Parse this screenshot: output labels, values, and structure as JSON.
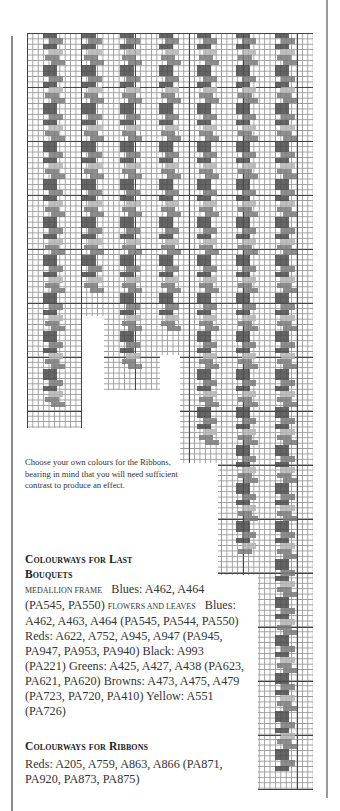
{
  "page": {
    "note": "Choose your own colours for the Ribbons, bearing in mind that you will need sufficient contrast to produce an effect.",
    "section1": {
      "heading_line1": "Colourways for Last",
      "heading_line2": "Bouquets",
      "medallion_label": "MEDALLION FRAME",
      "medallion_text": "Blues: A462, A464 (PA545, PA550)",
      "flowers_label": "FLOWERS AND LEAVES",
      "flowers_text": "Blues: A462, A463, A464 (PA545, PA544, PA550)   Reds: A622, A752, A945, A947 (PA945, PA947, PA953, PA940)   Black: A993 (PA221)   Greens: A425, A427, A438 (PA623, PA621, PA620)   Browns: A473, A475, A479 (PA723, PA720, PA410)   Yellow: A551 (PA726)"
    },
    "section2": {
      "heading": "Colourways for Ribbons",
      "text": "Reds: A205, A759, A863, A866 (PA871, PA920, PA873, PA875)"
    }
  },
  "chart_grid": {
    "type": "needlepoint-chart",
    "ribbon_columns": 7,
    "colors": {
      "dark": "#4a4a4a",
      "mid": "#7a7a7a",
      "light": "#b4b4b4",
      "grid_major": "#444444",
      "grid_minor": "#9a9a9a"
    }
  }
}
